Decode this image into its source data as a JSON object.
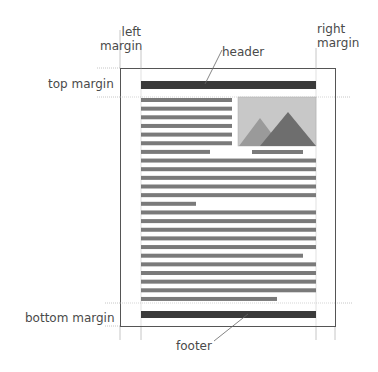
{
  "labels": {
    "left_margin_line1": "left",
    "left_margin_line2": "margin",
    "right_margin_line1": "right",
    "right_margin_line2": "margin",
    "header": "header",
    "top_margin": "top margin",
    "bottom_margin": "bottom margin",
    "footer": "footer"
  },
  "colors": {
    "page_border": "#555555",
    "guide": "#b8b8b8",
    "header_bar": "#3a3a3a",
    "footer_bar": "#3a3a3a",
    "text_line": "#7a7a7a",
    "image_bg": "#c8c8c8",
    "mountain_back": "#9a9a9a",
    "mountain_front": "#6e6e6e"
  },
  "page": {
    "x": 120,
    "y": 68,
    "width": 215,
    "height": 258,
    "margins": {
      "left_x": 141,
      "right_x": 316,
      "top_y": 97,
      "bottom_y": 303
    }
  },
  "header_bar": {
    "x": 141,
    "y": 81,
    "width": 175,
    "height": 8
  },
  "footer_bar": {
    "x": 141,
    "y": 311,
    "width": 175,
    "height": 7
  },
  "image": {
    "x": 238,
    "y": 97,
    "width": 78,
    "height": 49
  },
  "caption_line": {
    "x": 252,
    "y": 150,
    "width": 51
  },
  "text_lines": [
    {
      "x": 141,
      "w": 91
    },
    {
      "x": 141,
      "w": 91
    },
    {
      "x": 141,
      "w": 91
    },
    {
      "x": 141,
      "w": 91
    },
    {
      "x": 141,
      "w": 91
    },
    {
      "x": 141,
      "w": 91
    },
    {
      "x": 141,
      "w": 69
    },
    {
      "x": 141,
      "w": 175
    },
    {
      "x": 141,
      "w": 175
    },
    {
      "x": 141,
      "w": 175
    },
    {
      "x": 141,
      "w": 175
    },
    {
      "x": 141,
      "w": 175
    },
    {
      "x": 141,
      "w": 55
    },
    {
      "x": 141,
      "w": 175
    },
    {
      "x": 141,
      "w": 175
    },
    {
      "x": 141,
      "w": 175
    },
    {
      "x": 141,
      "w": 175
    },
    {
      "x": 141,
      "w": 175
    },
    {
      "x": 141,
      "w": 162
    },
    {
      "x": 141,
      "w": 175
    },
    {
      "x": 141,
      "w": 175
    },
    {
      "x": 141,
      "w": 175
    },
    {
      "x": 141,
      "w": 175
    },
    {
      "x": 141,
      "w": 136
    }
  ]
}
